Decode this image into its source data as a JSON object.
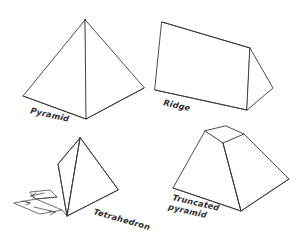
{
  "figure": {
    "background_color": "#ffffff",
    "line_color": "#3a3a3a"
  },
  "shapes": [
    {
      "id": "pyramid",
      "label": "Pyramid",
      "label_lines": [
        "Pyramid"
      ],
      "label_rotation_deg": 13
    },
    {
      "id": "ridge",
      "label": "Ridge",
      "label_lines": [
        "Ridge"
      ],
      "label_rotation_deg": 13
    },
    {
      "id": "tetrahedron",
      "label": "Tetrahedron",
      "label_lines": [
        "Tetrahedron"
      ],
      "label_rotation_deg": 16
    },
    {
      "id": "truncated-pyramid",
      "label": "Truncated pyramid",
      "label_lines": [
        "Truncated",
        "pyramid"
      ],
      "label_rotation_deg": 13
    }
  ],
  "labels": {
    "pyramid": "Pyramid",
    "ridge": "Ridge",
    "tetrahedron": "Tetrahedron",
    "truncated_pyramid_line1": "Truncated",
    "truncated_pyramid_line2": "pyramid"
  }
}
